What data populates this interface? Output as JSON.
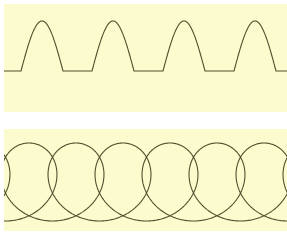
{
  "figure": {
    "width": 287,
    "height": 237,
    "page_background": "#ffffff",
    "panel_background": "#fbfbcd",
    "curve_color": "#4f4f2e",
    "stroke_width": 1.1
  },
  "panels": [
    {
      "name": "rectified-sine",
      "title": "Half-wave rectified sine",
      "x": 4,
      "y": 4,
      "width": 283,
      "height": 108
    },
    {
      "name": "prolate-cycloid",
      "title": "Prolate cycloid with loops",
      "x": 4,
      "y": 129,
      "width": 283,
      "height": 102
    }
  ],
  "chart_data": [
    {
      "type": "line",
      "name": "rectified-sine",
      "title": "Half-wave rectified sine wave",
      "description": "Series of identical positive arches separated by flat zero-level segments along a horizontal baseline.",
      "xlabel": "",
      "ylabel": "",
      "grid": false,
      "legend": null,
      "axis_visible": false,
      "panel_local_coords": {
        "baseline_y": 67,
        "peak_y": 17,
        "amplitude_px": 50,
        "period_px": 71,
        "arch_width_px": 42,
        "flat_gap_px": 29,
        "first_arch_start_x": 17,
        "arch_count": 4
      },
      "arches": [
        {
          "start_x": 17,
          "peak_x": 38,
          "end_x": 59
        },
        {
          "start_x": 88,
          "peak_x": 109,
          "end_x": 130
        },
        {
          "start_x": 159,
          "peak_x": 180,
          "end_x": 201
        },
        {
          "start_x": 230,
          "peak_x": 251,
          "end_x": 272
        }
      ],
      "formula": "y = max(0, A*sin(2*pi*x/T)) clipped to positive half cycles"
    },
    {
      "type": "line",
      "name": "prolate-cycloid",
      "title": "Prolate cycloid (looping trochoid)",
      "description": "Continuous self-intersecting curve forming a row of tall vertical loops whose crossings lie near the top of the panel.",
      "xlabel": "",
      "ylabel": "",
      "grid": false,
      "legend": null,
      "axis_visible": false,
      "panel_local_coords": {
        "crest_y": 14,
        "crossing_y": 22,
        "loop_bottom_y": 92,
        "period_px": 47,
        "loop_width_px": 30,
        "loop_count": 6,
        "first_crossing_x": 25
      },
      "crossings_x": [
        25,
        73,
        119,
        167,
        214,
        261
      ],
      "loops": [
        {
          "center_x": 25,
          "top_y": 22,
          "bottom_y": 92,
          "half_width": 15
        },
        {
          "center_x": 73,
          "top_y": 22,
          "bottom_y": 92,
          "half_width": 15
        },
        {
          "center_x": 119,
          "top_y": 22,
          "bottom_y": 92,
          "half_width": 15
        },
        {
          "center_x": 167,
          "top_y": 22,
          "bottom_y": 92,
          "half_width": 15
        },
        {
          "center_x": 214,
          "top_y": 22,
          "bottom_y": 92,
          "half_width": 15
        },
        {
          "center_x": 261,
          "top_y": 22,
          "bottom_y": 92,
          "half_width": 15
        }
      ],
      "formula": "x = a*t - b*sin(t), y = a - b*cos(t) with b > a (prolate)"
    }
  ]
}
